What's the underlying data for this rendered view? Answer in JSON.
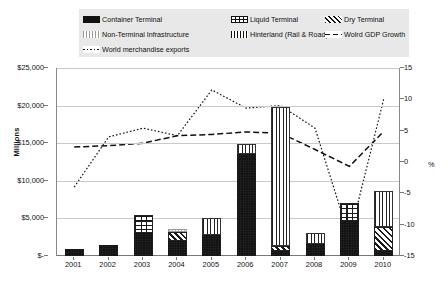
{
  "legend": {
    "items": [
      {
        "label": "Container Terminal",
        "swatch": "container-swatch",
        "row": 0,
        "col": 0
      },
      {
        "label": "Liquid Terminal",
        "swatch": "liquid-swatch",
        "row": 0,
        "col": 1
      },
      {
        "label": "Dry Terminal",
        "swatch": "dry-swatch",
        "row": 0,
        "col": 2
      },
      {
        "label": "Non-Terminal Infrastructure",
        "swatch": "nonterminal-swatch",
        "row": 1,
        "col": 0
      },
      {
        "label": "Hinterland (Rail & Road)",
        "swatch": "hinterland-swatch",
        "row": 1,
        "col": 1
      },
      {
        "label": "Wolrd GDP Growth",
        "swatch": "gdp-line-swatch",
        "row": 1,
        "col": 2
      },
      {
        "label": "World merchandise exports",
        "swatch": "exports-line-swatch",
        "row": 2,
        "col": 0
      }
    ]
  },
  "axes": {
    "left_title": "Millions",
    "right_title": "%",
    "left_ticks": [
      "$25,000",
      "$20,000",
      "$15,000",
      "$10,000",
      "$5,000",
      "$-"
    ],
    "right_ticks": [
      "15",
      "10",
      "5",
      "0",
      "-5",
      "-10",
      "-15"
    ],
    "left_min": 0,
    "left_max": 25000,
    "right_min": -15,
    "right_max": 15
  },
  "chart_data": {
    "type": "bar",
    "title": "",
    "subtitle": "",
    "xlabel": "",
    "ylabel": "Millions",
    "y2label": "%",
    "ylim": [
      0,
      25000
    ],
    "y2lim": [
      -15,
      15
    ],
    "grid": true,
    "legend_position": "top",
    "categories": [
      "2001",
      "2002",
      "2003",
      "2004",
      "2005",
      "2006",
      "2007",
      "2008",
      "2009",
      "2010"
    ],
    "series": [
      {
        "name": "Container Terminal",
        "type": "bar",
        "stack": "investment",
        "axis": "left",
        "values": [
          900,
          1500,
          3050,
          1950,
          2750,
          13500,
          700,
          1600,
          4600,
          650
        ]
      },
      {
        "name": "Liquid Terminal",
        "type": "bar",
        "stack": "investment",
        "axis": "left",
        "values": [
          0,
          0,
          2350,
          0,
          0,
          0,
          0,
          0,
          2450,
          0
        ]
      },
      {
        "name": "Dry Terminal",
        "type": "bar",
        "stack": "investment",
        "axis": "left",
        "values": [
          0,
          0,
          0,
          1300,
          0,
          0,
          700,
          0,
          0,
          3150
        ]
      },
      {
        "name": "Non-Terminal Infrastructure",
        "type": "bar",
        "stack": "investment",
        "axis": "left",
        "values": [
          0,
          0,
          0,
          350,
          0,
          0,
          0,
          0,
          0,
          0
        ]
      },
      {
        "name": "Hinterland (Rail & Road)",
        "type": "bar",
        "stack": "investment",
        "axis": "left",
        "values": [
          0,
          0,
          0,
          0,
          2350,
          1400,
          18400,
          1500,
          0,
          4800
        ]
      },
      {
        "name": "Wolrd GDP Growth",
        "type": "line",
        "style": "dashed",
        "axis": "right",
        "values": [
          2.4,
          2.6,
          3.0,
          4.2,
          4.4,
          4.8,
          4.6,
          2.0,
          -0.7,
          4.9
        ]
      },
      {
        "name": "World merchandise exports",
        "type": "line",
        "style": "dotted",
        "axis": "right",
        "values": [
          -4.0,
          4.0,
          5.4,
          4.2,
          11.5,
          8.6,
          9.0,
          5.4,
          -12.0,
          10.1
        ]
      }
    ]
  }
}
